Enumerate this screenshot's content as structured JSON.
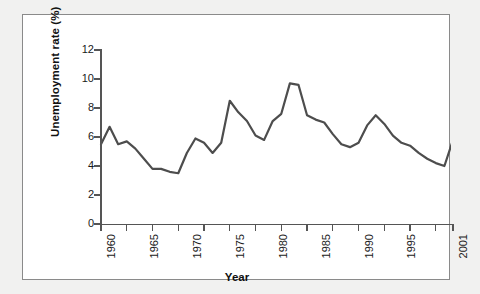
{
  "figure": {
    "background_color": "#f1f1f0",
    "panel_color": "#ffffff",
    "border_color": "#8a8a8a"
  },
  "chart_data": {
    "type": "line",
    "title": "",
    "xlabel": "Year",
    "ylabel": "Unemployment rate (%)",
    "xlim": [
      1960,
      2001
    ],
    "ylim": [
      0,
      12
    ],
    "ytick_labels": [
      "0",
      "2",
      "4",
      "6",
      "8",
      "10",
      "12"
    ],
    "ytick_values": [
      0,
      2,
      4,
      6,
      8,
      10,
      12
    ],
    "xtick_values": [
      1960,
      1963,
      1966,
      1969,
      1972,
      1975,
      1978,
      1981,
      1984,
      1987,
      1990,
      1993,
      1996,
      1999,
      2001
    ],
    "xtick_labels": [
      "1960",
      "",
      "1965",
      "",
      "1970",
      "",
      "1975",
      "",
      "1980",
      "",
      "1985",
      "",
      "1990",
      "",
      "1995",
      "",
      "2001"
    ],
    "xtick_labeled": [
      {
        "value": 1960,
        "label": "1960"
      },
      {
        "value": 1965,
        "label": "1965"
      },
      {
        "value": 1970,
        "label": "1970"
      },
      {
        "value": 1975,
        "label": "1975"
      },
      {
        "value": 1980,
        "label": "1980"
      },
      {
        "value": 1985,
        "label": "1985"
      },
      {
        "value": 1990,
        "label": "1990"
      },
      {
        "value": 1995,
        "label": "1995"
      },
      {
        "value": 2001,
        "label": "2001"
      }
    ],
    "grid": false,
    "legend": false,
    "line_color": "#4d4d4d",
    "line_width": 2.2,
    "x": [
      1960,
      1961,
      1962,
      1963,
      1964,
      1965,
      1966,
      1967,
      1968,
      1969,
      1970,
      1971,
      1972,
      1973,
      1974,
      1975,
      1976,
      1977,
      1978,
      1979,
      1980,
      1981,
      1982,
      1983,
      1984,
      1985,
      1986,
      1987,
      1988,
      1989,
      1990,
      1991,
      1992,
      1993,
      1994,
      1995,
      1996,
      1997,
      1998,
      1999,
      2000,
      2001
    ],
    "values": [
      5.5,
      6.7,
      5.5,
      5.7,
      5.2,
      4.5,
      3.8,
      3.8,
      3.6,
      3.5,
      4.9,
      5.9,
      5.6,
      4.9,
      5.6,
      8.5,
      7.7,
      7.1,
      6.1,
      5.8,
      7.1,
      7.6,
      9.7,
      9.6,
      7.5,
      7.2,
      7.0,
      6.2,
      5.5,
      5.3,
      5.6,
      6.8,
      7.5,
      6.9,
      6.1,
      5.6,
      5.4,
      4.9,
      4.5,
      4.2,
      4.0,
      5.8
    ],
    "series": [
      {
        "name": "Unemployment rate",
        "values": [
          5.5,
          6.7,
          5.5,
          5.7,
          5.2,
          4.5,
          3.8,
          3.8,
          3.6,
          3.5,
          4.9,
          5.9,
          5.6,
          4.9,
          5.6,
          8.5,
          7.7,
          7.1,
          6.1,
          5.8,
          7.1,
          7.6,
          9.7,
          9.6,
          7.5,
          7.2,
          7.0,
          6.2,
          5.5,
          5.3,
          5.6,
          6.8,
          7.5,
          6.9,
          6.1,
          5.6,
          5.4,
          4.9,
          4.5,
          4.2,
          4.0,
          5.8
        ]
      }
    ]
  }
}
